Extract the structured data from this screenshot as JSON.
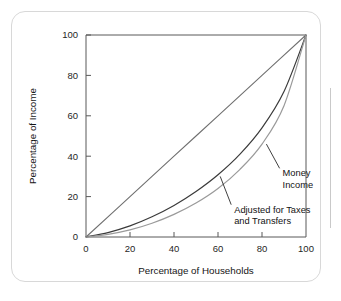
{
  "chart_data": {
    "type": "line",
    "title": "",
    "subtitle": "",
    "xlabel": "Percentage of Households",
    "ylabel": "Percentage of Income",
    "xlim": [
      0,
      100
    ],
    "ylim": [
      0,
      100
    ],
    "xticks": [
      0,
      20,
      40,
      60,
      80,
      100
    ],
    "yticks": [
      0,
      20,
      40,
      60,
      80,
      100
    ],
    "xtick_labels": [
      "0",
      "20",
      "40",
      "60",
      "80",
      "100"
    ],
    "ytick_labels": [
      "0",
      "20",
      "40",
      "60",
      "80",
      "100"
    ],
    "grid": false,
    "legend": "none",
    "annotations": [
      {
        "id": "money-income",
        "text_lines": [
          "Money",
          "Income"
        ],
        "text": "Money Income",
        "anchor_x": 82,
        "anchor_y": 46,
        "label_x": 88,
        "label_y": 34
      },
      {
        "id": "adjusted-taxes-transfers",
        "text_lines": [
          "Adjusted for Taxes",
          "and Transfers"
        ],
        "text": "Adjusted for Taxes and Transfers",
        "anchor_x": 61,
        "anchor_y": 30,
        "label_x": 66,
        "label_y": 16
      }
    ],
    "series": [
      {
        "name": "Line of equality",
        "color": "#6f6f6f",
        "width": 1.1,
        "x": [
          0,
          20,
          40,
          60,
          80,
          100
        ],
        "values": [
          0,
          20,
          40,
          60,
          80,
          100
        ]
      },
      {
        "name": "Adjusted for Taxes and Transfers",
        "color": "#3a3a3a",
        "width": 1.2,
        "x": [
          0,
          10,
          20,
          30,
          40,
          50,
          60,
          70,
          80,
          90,
          100
        ],
        "values": [
          0,
          2.2,
          5.5,
          10.0,
          15.6,
          22.5,
          30.8,
          41.0,
          54.0,
          72.0,
          100
        ]
      },
      {
        "name": "Money Income",
        "color": "#9a9a9a",
        "width": 1.2,
        "x": [
          0,
          10,
          20,
          30,
          40,
          50,
          60,
          70,
          80,
          90,
          100
        ],
        "values": [
          0,
          1.3,
          3.5,
          6.8,
          11.2,
          16.8,
          24.0,
          33.5,
          46.0,
          65.0,
          100
        ]
      }
    ]
  },
  "axes": {
    "y_title": "Percentage of Income",
    "x_title": "Percentage of Households"
  }
}
